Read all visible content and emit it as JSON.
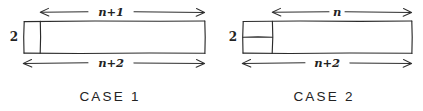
{
  "figure": {
    "title_visible": false,
    "background_color": "#ffffff",
    "ink_color": "#2b2b2b",
    "style": "hand-drawn pencil sketch"
  },
  "case1": {
    "caption": "CASE  1",
    "height_label": "2",
    "top_dimension_label": "n+1",
    "bottom_dimension_label": "n+2",
    "board": {
      "x": 24,
      "y": 21,
      "width": 181,
      "height": 32,
      "description": "2 by n+2 rectangle"
    },
    "divider": {
      "orientation": "vertical",
      "x": 40,
      "description": "vertical domino covering the leftmost column"
    },
    "top_arrow": {
      "x1": 40,
      "x2": 205,
      "y": 12
    },
    "bottom_arrow": {
      "x1": 23,
      "x2": 205,
      "y": 63
    }
  },
  "case2": {
    "caption": "CASE  2",
    "height_label": "2",
    "top_dimension_label": "n",
    "bottom_dimension_label": "n+2",
    "board": {
      "x": 243,
      "y": 21,
      "width": 169,
      "height": 32,
      "description": "2 by n+2 rectangle"
    },
    "divider_vertical": {
      "orientation": "vertical",
      "x": 272,
      "description": "boundary of the 2 by 2 block at the left"
    },
    "divider_horizontal": {
      "orientation": "horizontal",
      "y": 37,
      "x1": 243,
      "x2": 272,
      "description": "two stacked horizontal dominoes"
    },
    "top_arrow": {
      "x1": 272,
      "x2": 412,
      "y": 12
    },
    "bottom_arrow": {
      "x1": 242,
      "x2": 412,
      "y": 63
    }
  }
}
